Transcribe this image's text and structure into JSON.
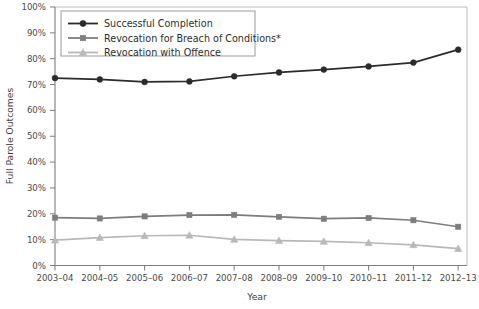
{
  "chart_data": {
    "type": "line",
    "title": "",
    "xlabel": "Year",
    "ylabel": "Full Parole Outcomes",
    "categories": [
      "2003–04",
      "2004–05",
      "2005–06",
      "2006–07",
      "2007–08",
      "2008–09",
      "2009–10",
      "2010–11",
      "2011–12",
      "2012–13"
    ],
    "ylim": [
      0,
      100
    ],
    "y_ticks": [
      0,
      10,
      20,
      30,
      40,
      50,
      60,
      70,
      80,
      90,
      100
    ],
    "y_tick_labels": [
      "0%",
      "10%",
      "20%",
      "30%",
      "40%",
      "50%",
      "60%",
      "70%",
      "80%",
      "90%",
      "100%"
    ],
    "grid": false,
    "legend_position": "top-left",
    "series": [
      {
        "name": "Successful Completion",
        "color": "#2b2b2b",
        "marker": "circle",
        "values": [
          72.5,
          72.0,
          71.0,
          71.2,
          73.2,
          74.7,
          75.8,
          77.0,
          78.5,
          83.5
        ]
      },
      {
        "name": "Revocation for Breach of Conditions*",
        "color": "#7d7d7d",
        "marker": "square",
        "values": [
          18.5,
          18.2,
          19.0,
          19.5,
          19.6,
          18.8,
          18.1,
          18.4,
          17.5,
          15.0
        ]
      },
      {
        "name": "Revocation with Offence",
        "color": "#b8b8b8",
        "marker": "triangle",
        "values": [
          9.8,
          10.8,
          11.5,
          11.7,
          10.1,
          9.6,
          9.3,
          8.8,
          8.0,
          6.5
        ]
      }
    ]
  },
  "axes": {
    "frame_color": "#b0b0b0",
    "axis_color": "#8a8a8a"
  },
  "legend": {
    "border_color": "#9a9a9a",
    "background": "#ffffff"
  }
}
